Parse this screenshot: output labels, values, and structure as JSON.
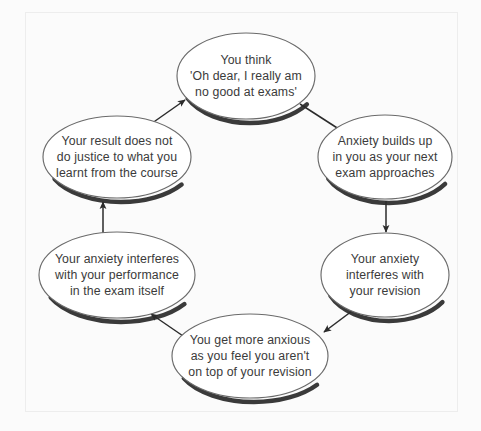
{
  "diagram": {
    "type": "cycle-diagram",
    "direction": "clockwise",
    "node_count": 6,
    "colors": {
      "background": "#fbfbfb",
      "node_fill": "#ffffff",
      "node_stroke": "#6b6b6b",
      "node_shadow": "#3a3a3a",
      "text": "#3b3b3b",
      "arrow": "#2b2b2b",
      "frame": "#ededed"
    },
    "nodes": [
      {
        "id": "node-you-think",
        "name": "you-think",
        "position": "top",
        "cx": 246,
        "cy": 76,
        "rx": 69,
        "ry": 43,
        "lines": [
          "You think",
          "'Oh dear, I really am",
          "no good at exams'"
        ]
      },
      {
        "id": "node-anxiety-builds",
        "name": "anxiety-builds-up",
        "position": "top-right",
        "cx": 385,
        "cy": 157,
        "rx": 67,
        "ry": 42,
        "lines": [
          "Anxiety builds up",
          "in you as your next",
          "exam approaches"
        ]
      },
      {
        "id": "node-interferes-revision",
        "name": "interferes-with-revision",
        "position": "bottom-right",
        "cx": 385,
        "cy": 275,
        "rx": 64,
        "ry": 42,
        "lines": [
          "Your anxiety",
          "interferes with",
          "your revision"
        ]
      },
      {
        "id": "node-more-anxious",
        "name": "more-anxious-not-on-top",
        "position": "bottom",
        "cx": 250,
        "cy": 356,
        "rx": 78,
        "ry": 42,
        "lines": [
          "You get more anxious",
          "as you feel you aren't",
          "on top of your revision"
        ]
      },
      {
        "id": "node-interferes-exam",
        "name": "interferes-with-exam-performance",
        "position": "bottom-left",
        "cx": 117,
        "cy": 275,
        "rx": 78,
        "ry": 43,
        "lines": [
          "Your anxiety interferes",
          "with your performance",
          "in the exam itself"
        ]
      },
      {
        "id": "node-result-injustice",
        "name": "result-does-not-do-justice",
        "position": "top-left",
        "cx": 117,
        "cy": 157,
        "rx": 74,
        "ry": 41,
        "lines": [
          "Your result does not",
          "do justice to what you",
          "learnt from the course"
        ]
      }
    ],
    "arrows": [
      {
        "id": "arrow-1",
        "name": "arrow-you-think-to-anxiety-builds",
        "from": "node-you-think",
        "to": "node-anxiety-builds",
        "path": "M 300 104 L 345 133",
        "direction": "down-right"
      },
      {
        "id": "arrow-2",
        "name": "arrow-anxiety-builds-to-interferes-revision",
        "from": "node-anxiety-builds",
        "to": "node-interferes-revision",
        "path": "M 386 200 L 386 231",
        "direction": "down"
      },
      {
        "id": "arrow-3",
        "name": "arrow-interferes-revision-to-more-anxious",
        "from": "node-interferes-revision",
        "to": "node-more-anxious",
        "path": "M 355 307 L 323 331",
        "direction": "down-left"
      },
      {
        "id": "arrow-4",
        "name": "arrow-more-anxious-to-interferes-exam",
        "from": "node-more-anxious",
        "to": "node-interferes-exam",
        "path": "M 185 337 L 150 313",
        "direction": "up-left"
      },
      {
        "id": "arrow-5",
        "name": "arrow-interferes-exam-to-result-injustice",
        "from": "node-interferes-exam",
        "to": "node-result-injustice",
        "path": "M 103 233 L 103 201",
        "direction": "up"
      },
      {
        "id": "arrow-6",
        "name": "arrow-result-injustice-to-you-think",
        "from": "node-result-injustice",
        "to": "node-you-think",
        "path": "M 148 126 L 184 99",
        "direction": "up-right"
      }
    ]
  }
}
